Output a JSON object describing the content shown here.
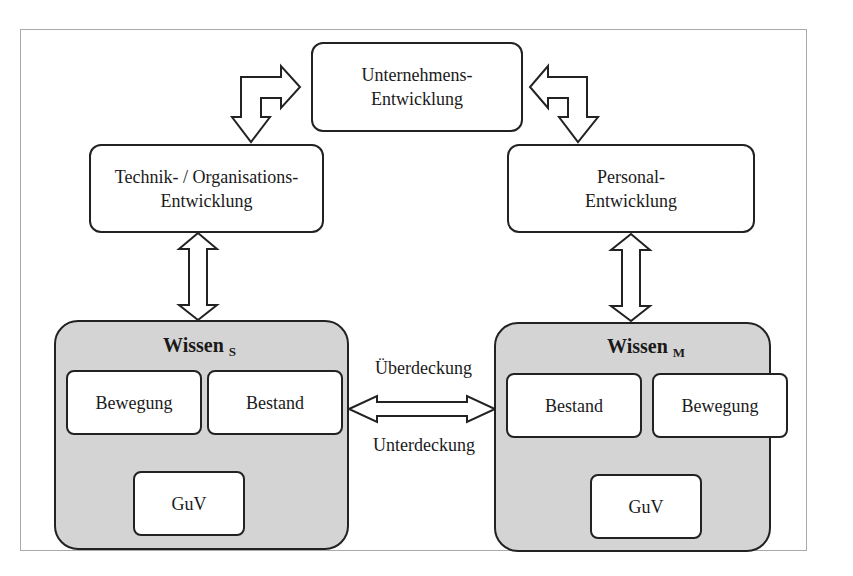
{
  "diagram": {
    "top": {
      "line1": "Unternehmens-",
      "line2": "Entwicklung"
    },
    "left": {
      "line1": "Technik- / Organisations-",
      "line2": "Entwicklung"
    },
    "right": {
      "line1": "Personal-",
      "line2": "Entwicklung"
    },
    "wissen_s": {
      "title": "Wissen",
      "sub": "S",
      "left": "Bewegung",
      "right": "Bestand",
      "bottom": "GuV"
    },
    "wissen_m": {
      "title": "Wissen",
      "sub": "M",
      "left": "Bestand",
      "right": "Bewegung",
      "bottom": "GuV"
    },
    "link": {
      "above": "Überdeckung",
      "below": "Unterdeckung"
    },
    "colors": {
      "group_fill": "#d4d4d4",
      "stroke": "#222222",
      "frame": "#aaaaaa"
    }
  }
}
